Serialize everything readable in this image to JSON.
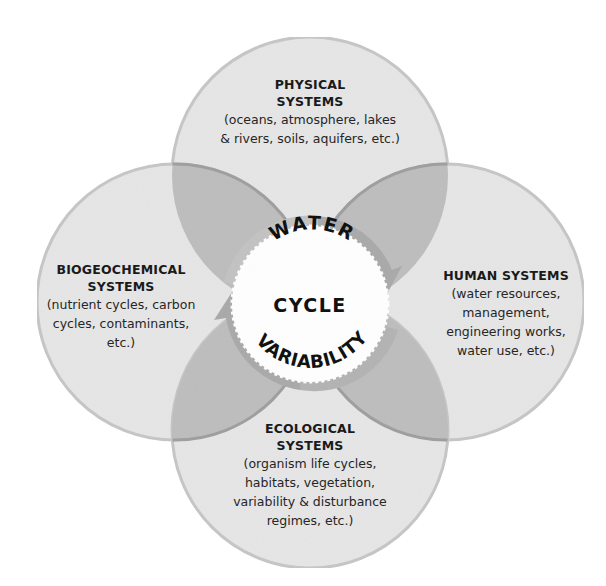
{
  "diagram": {
    "center": {
      "line1": "WATER",
      "line2": "CYCLE",
      "line3": "VARIABILITY"
    },
    "nodes": [
      {
        "id": "physical",
        "position": "top",
        "title_line1": "PHYSICAL",
        "title_line2": "SYSTEMS",
        "desc_line1": "(oceans, atmosphere, lakes",
        "desc_line2": "& rivers, soils, aquifers, etc.)"
      },
      {
        "id": "human",
        "position": "right",
        "title_line1": "HUMAN SYSTEMS",
        "desc_line1": "(water resources,",
        "desc_line2": "management,",
        "desc_line3": "engineering works,",
        "desc_line4": "water use, etc.)"
      },
      {
        "id": "ecological",
        "position": "bottom",
        "title_line1": "ECOLOGICAL",
        "title_line2": "SYSTEMS",
        "desc_line1": "(organism life cycles,",
        "desc_line2": "habitats, vegetation,",
        "desc_line3": "variability & disturbance",
        "desc_line4": "regimes, etc.)"
      },
      {
        "id": "biogeochemical",
        "position": "left",
        "title_line1": "BIOGEOCHEMICAL",
        "title_line2": "SYSTEMS",
        "desc_line1": "(nutrient cycles, carbon",
        "desc_line2": "cycles, contaminants,",
        "desc_line3": "etc.)"
      }
    ],
    "colors": {
      "circle_fill": "#e6e6e6",
      "circle_stroke": "#c4c4c4",
      "overlap_fill": "#bdbdbd",
      "arrow_fill": "#a8a8a8",
      "center_fill": "#ffffff",
      "text": "#1a1a1a"
    }
  }
}
